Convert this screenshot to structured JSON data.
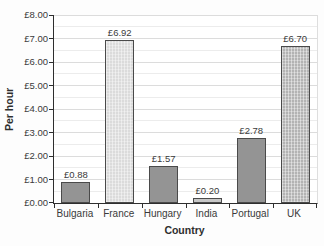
{
  "chart_data": {
    "type": "bar",
    "title": "",
    "xlabel": "Country",
    "ylabel": "Per hour",
    "categories": [
      "Bulgaria",
      "France",
      "Hungary",
      "India",
      "Portugal",
      "UK"
    ],
    "values": [
      0.88,
      6.92,
      1.57,
      0.2,
      2.78,
      6.7
    ],
    "bar_labels": [
      "£0.88",
      "£6.92",
      "£1.57",
      "£0.20",
      "£2.78",
      "£6.70"
    ],
    "ylim": [
      0,
      8
    ],
    "ytick_labels": [
      "£0.00",
      "£1.00",
      "£2.00",
      "£3.00",
      "£4.00",
      "£5.00",
      "£6.00",
      "£7.00",
      "£8.00"
    ],
    "ytick_step": 1,
    "minor_grid_step": 0.5,
    "grid": true,
    "legend": "none",
    "bar_colors": [
      "#949494",
      "#dbdbdb",
      "#949494",
      "#c7c7c7",
      "#949494",
      "#b3b3b3"
    ],
    "bar_patterns": [
      "solid",
      "dotted",
      "solid",
      "solid",
      "solid",
      "dotted"
    ],
    "axis_color": "#2e2e2e",
    "major_grid_color": "#dcdcdc",
    "minor_grid_color": "#ececec"
  }
}
